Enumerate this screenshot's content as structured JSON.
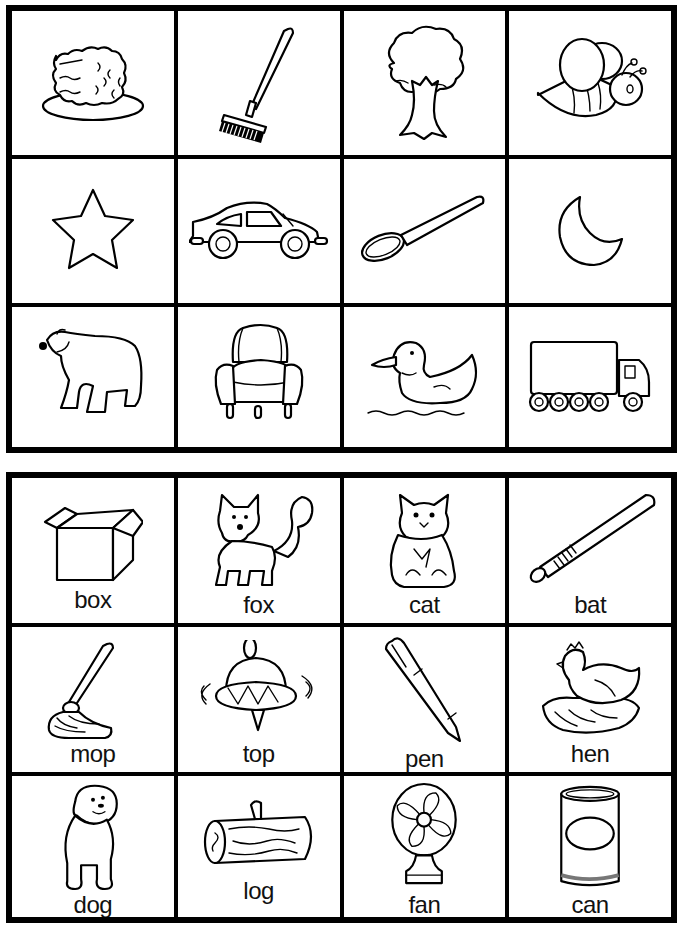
{
  "worksheet": {
    "picture_grid": {
      "rows": [
        [
          {
            "icon": "cake"
          },
          {
            "icon": "rake"
          },
          {
            "icon": "tree"
          },
          {
            "icon": "bee"
          }
        ],
        [
          {
            "icon": "star"
          },
          {
            "icon": "car"
          },
          {
            "icon": "spoon"
          },
          {
            "icon": "moon"
          }
        ],
        [
          {
            "icon": "bear"
          },
          {
            "icon": "chair"
          },
          {
            "icon": "duck"
          },
          {
            "icon": "truck"
          }
        ]
      ]
    },
    "word_grid": {
      "rows": [
        [
          {
            "icon": "box",
            "label": "box"
          },
          {
            "icon": "fox",
            "label": "fox"
          },
          {
            "icon": "cat",
            "label": "cat"
          },
          {
            "icon": "bat",
            "label": "bat"
          }
        ],
        [
          {
            "icon": "mop",
            "label": "mop"
          },
          {
            "icon": "top",
            "label": "top"
          },
          {
            "icon": "pen",
            "label": "pen"
          },
          {
            "icon": "hen",
            "label": "hen"
          }
        ],
        [
          {
            "icon": "dog",
            "label": "dog"
          },
          {
            "icon": "log",
            "label": "log"
          },
          {
            "icon": "fan",
            "label": "fan"
          },
          {
            "icon": "can",
            "label": "can"
          }
        ]
      ]
    },
    "colors": {
      "border": "#000000",
      "background": "#ffffff",
      "text": "#111111"
    }
  }
}
